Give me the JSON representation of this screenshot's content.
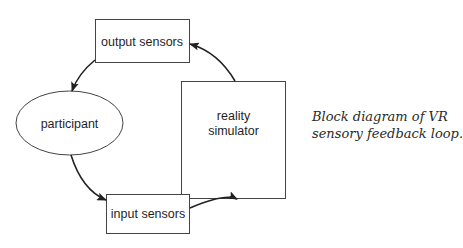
{
  "diagram": {
    "title": "VR sensory feedback loop",
    "nodes": {
      "output_sensors": {
        "label": "output sensors",
        "shape": "rectangle"
      },
      "participant": {
        "label": "participant",
        "shape": "ellipse"
      },
      "reality_simulator": {
        "label_line1": "reality",
        "label_line2": "simulator",
        "shape": "rectangle"
      },
      "input_sensors": {
        "label": "input sensors",
        "shape": "rectangle"
      }
    },
    "edges": [
      {
        "from": "output sensors",
        "to": "participant"
      },
      {
        "from": "participant",
        "to": "input sensors"
      },
      {
        "from": "input sensors",
        "to": "reality simulator"
      },
      {
        "from": "reality simulator",
        "to": "output sensors"
      }
    ]
  },
  "caption": {
    "line1": "Block diagram of VR",
    "line2": "sensory feedback loop."
  },
  "colors": {
    "stroke": "#333333",
    "text": "#1f1f1f",
    "background": "#ffffff"
  }
}
